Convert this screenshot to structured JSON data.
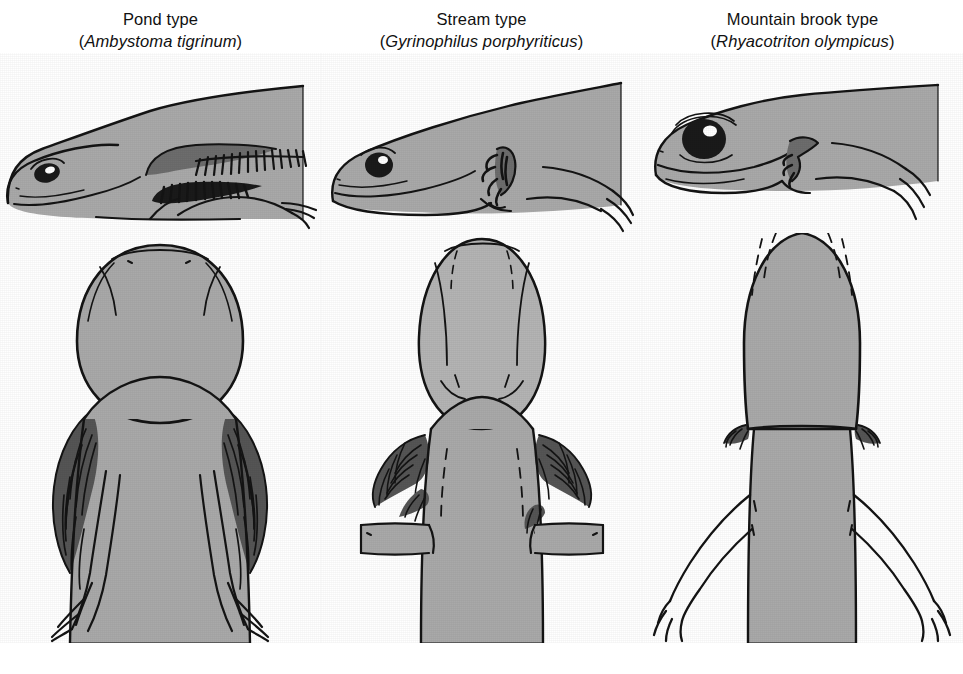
{
  "figure": {
    "background_color": "#ffffff",
    "body_fill_color": "#a9a9a9",
    "gill_fill_color": "#6d6d6d",
    "ink_color": "#141414"
  },
  "columns": [
    {
      "id": "pond",
      "common_name": "Pond type",
      "scientific_name": "Ambystoma tigrinum",
      "open_paren": "(",
      "close_paren": ")",
      "lateral_view_label": "lateral view",
      "dorsal_view_label": "dorsal view",
      "gill_description": "large bushy gills",
      "eye_description": "small eye",
      "fin_description": "tall dorsal fin extending onto body"
    },
    {
      "id": "stream",
      "common_name": "Stream type",
      "scientific_name": "Gyrinophilus porphyriticus",
      "open_paren": "(",
      "close_paren": ")",
      "lateral_view_label": "lateral view",
      "dorsal_view_label": "dorsal view",
      "gill_description": "reduced gills",
      "eye_description": "medium eye",
      "fin_description": "low dorsal fin"
    },
    {
      "id": "mountain-brook",
      "common_name": "Mountain brook type",
      "scientific_name": "Rhyacotriton olympicus",
      "open_paren": "(",
      "close_paren": ")",
      "lateral_view_label": "lateral view",
      "dorsal_view_label": "dorsal view",
      "gill_description": "greatly reduced gill stubs",
      "eye_description": "large prominent eye",
      "fin_description": "no dorsal fin on body"
    }
  ]
}
